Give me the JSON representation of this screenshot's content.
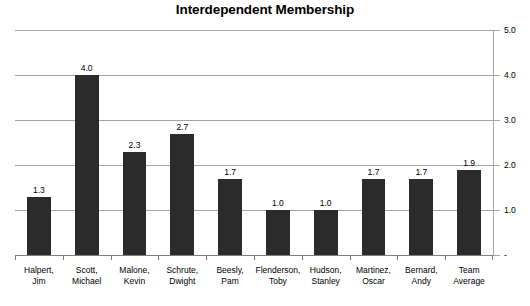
{
  "chart_data": {
    "type": "bar",
    "title": "Interdependent Membership",
    "xlabel": "",
    "ylabel": "",
    "ylim": [
      0,
      5
    ],
    "ytick_labels": [
      "5.0",
      "4.0",
      "3.0",
      "2.0",
      "1.0",
      "-"
    ],
    "ytick_values": [
      5,
      4,
      3,
      2,
      1,
      0
    ],
    "grid": true,
    "legend": false,
    "y_axis_position": "right",
    "bar_color": "#2b2b2b",
    "gridline_color": "#a6a6a6",
    "categories": [
      "Halpert, Jim",
      "Scott, Michael",
      "Malone, Kevin",
      "Schrute, Dwight",
      "Beesly, Pam",
      "Flenderson, Toby",
      "Hudson, Stanley",
      "Martinez, Oscar",
      "Bernard, Andy",
      "Team Average"
    ],
    "category_lines": [
      [
        "Halpert,",
        "Jim"
      ],
      [
        "Scott,",
        "Michael"
      ],
      [
        "Malone,",
        "Kevin"
      ],
      [
        "Schrute,",
        "Dwight"
      ],
      [
        "Beesly,",
        "Pam"
      ],
      [
        "Flenderson,",
        "Toby"
      ],
      [
        "Hudson,",
        "Stanley"
      ],
      [
        "Martinez,",
        "Oscar"
      ],
      [
        "Bernard,",
        "Andy"
      ],
      [
        "Team",
        "Average"
      ]
    ],
    "values": [
      1.3,
      4.0,
      2.3,
      2.7,
      1.7,
      1.0,
      1.0,
      1.7,
      1.7,
      1.9
    ],
    "data_labels": [
      "1.3",
      "4.0",
      "2.3",
      "2.7",
      "1.7",
      "1.0",
      "1.0",
      "1.7",
      "1.7",
      "1.9"
    ]
  }
}
